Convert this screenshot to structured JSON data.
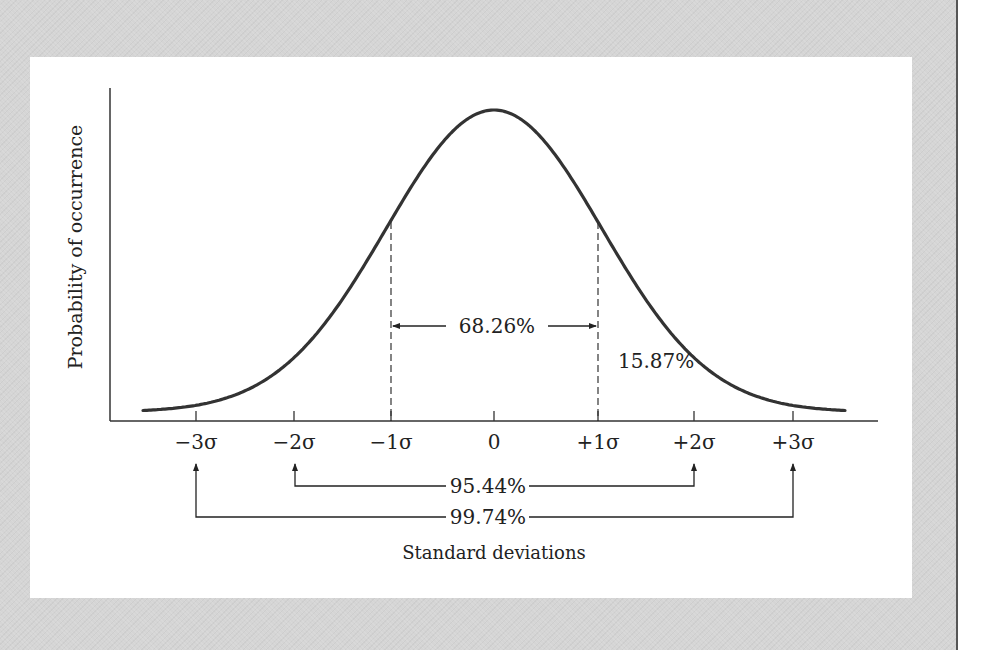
{
  "colors": {
    "background": "#d5d5d5",
    "panel": "#ffffff",
    "ink": "#222222",
    "curve": "#333333",
    "edge_line": "#555555"
  },
  "chart_data": {
    "type": "line",
    "title": "",
    "xlabel": "Standard deviations",
    "ylabel": "Probability of occurrence",
    "x_ticks": [
      "−3σ",
      "−2σ",
      "−1σ",
      "0",
      "+1σ",
      "+2σ",
      "+3σ"
    ],
    "x_tick_values": [
      -3,
      -2,
      -1,
      0,
      1,
      2,
      3
    ],
    "curve": {
      "distribution": "normal",
      "mean": 0,
      "sd": 1,
      "x_range": [
        -3.5,
        3.5
      ]
    },
    "grid": false,
    "legend": null,
    "annotations": [
      {
        "label": "68.26%",
        "range": [
          -1,
          1
        ],
        "style": "double-arrow between dashed lines"
      },
      {
        "label": "15.87%",
        "region": "tail beyond +1σ"
      },
      {
        "label": "95.44%",
        "range": [
          -2,
          2
        ],
        "style": "bracket arrows up to axis"
      },
      {
        "label": "99.74%",
        "range": [
          -3,
          3
        ],
        "style": "bracket arrows up to axis"
      }
    ]
  },
  "layout": {
    "axis": {
      "x0": 110,
      "x1": 878,
      "y_axis_top": 88,
      "baseline": 421
    },
    "curve": {
      "center_px": 494,
      "sigma_px": 108,
      "peak_y": 110,
      "base_y": 412,
      "x_start": 143,
      "x_end": 846
    },
    "tick_px": [
      196,
      294,
      391,
      494,
      598,
      694,
      793
    ]
  },
  "labels": {
    "pct_68": "68.26%",
    "pct_15": "15.87%",
    "pct_95": "95.44%",
    "pct_99": "99.74%",
    "xlabel": "Standard deviations",
    "ylabel": "Probability of occurrence",
    "ticks": [
      "−3σ",
      "−2σ",
      "−1σ",
      "0",
      "+1σ",
      "+2σ",
      "+3σ"
    ]
  }
}
